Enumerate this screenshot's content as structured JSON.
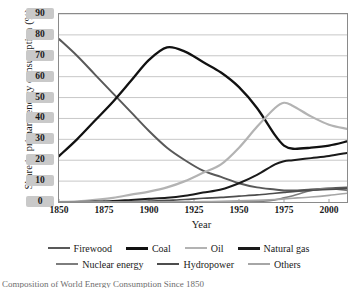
{
  "chart_data": {
    "type": "line",
    "title": "",
    "xlabel": "Year",
    "ylabel": "Share in primary energy consumption  (%)",
    "xlim": [
      1850,
      2010
    ],
    "ylim": [
      0,
      90
    ],
    "xticks": [
      1850,
      1875,
      1900,
      1925,
      1950,
      1975,
      2000
    ],
    "yticks": [
      0,
      10,
      20,
      30,
      40,
      50,
      60,
      70,
      80,
      90
    ],
    "grid": "horizontal",
    "legend_position": "bottom",
    "x": [
      1850,
      1860,
      1870,
      1880,
      1890,
      1900,
      1910,
      1920,
      1930,
      1940,
      1950,
      1960,
      1970,
      1975,
      1980,
      1990,
      2000,
      2010
    ],
    "series": [
      {
        "name": "Firewood",
        "color": "#595959",
        "width": 2.0,
        "values": [
          78,
          70,
          61,
          52,
          43,
          34,
          26,
          20,
          15,
          12,
          9,
          7,
          6,
          5.5,
          5.5,
          6,
          6.5,
          7
        ]
      },
      {
        "name": "Coal",
        "color": "#111111",
        "width": 2.3,
        "values": [
          22,
          30,
          39,
          48,
          58,
          68,
          74,
          72,
          67,
          62,
          55,
          45,
          32,
          27,
          25.5,
          26,
          27,
          29
        ]
      },
      {
        "name": "Oil",
        "color": "#b3b3b3",
        "width": 2.2,
        "values": [
          0,
          0.3,
          1,
          2,
          3.5,
          5,
          7,
          10,
          14,
          18,
          26,
          36,
          45,
          47.5,
          46,
          41,
          37,
          35
        ]
      },
      {
        "name": "Natural gas",
        "color": "#1a1a1a",
        "width": 2.0,
        "values": [
          0,
          0,
          0.2,
          0.5,
          1,
          1.5,
          2,
          3,
          4.5,
          6,
          9,
          13,
          18,
          19.5,
          20,
          21,
          22,
          23.5
        ]
      },
      {
        "name": "Nuclear energy",
        "color": "#7d7d7d",
        "width": 1.7,
        "values": [
          0,
          0,
          0,
          0,
          0,
          0,
          0,
          0,
          0,
          0,
          0,
          0.2,
          1,
          2,
          3,
          5.5,
          6.5,
          5.5
        ]
      },
      {
        "name": "Hydropower",
        "color": "#4d4d4d",
        "width": 1.7,
        "values": [
          0,
          0,
          0,
          0,
          0.2,
          0.4,
          0.8,
          1.2,
          1.8,
          2.2,
          2.8,
          3.4,
          4.2,
          4.6,
          5,
          5.6,
          6,
          6.4
        ]
      },
      {
        "name": "Others",
        "color": "#a6a6a6",
        "width": 1.7,
        "values": [
          0,
          0,
          0,
          0,
          0,
          0,
          0,
          0,
          0.2,
          0.3,
          0.5,
          0.8,
          1.2,
          1.5,
          1.8,
          2.4,
          3.2,
          4.2
        ]
      }
    ]
  },
  "axis": {
    "y_title": "Share in primary energy consumption  (%)",
    "x_title": "Year",
    "y_labels": [
      "90",
      "80",
      "70",
      "60",
      "50",
      "40",
      "30",
      "20",
      "10",
      "0"
    ],
    "x_labels": [
      "1850",
      "1875",
      "1900",
      "1925",
      "1950",
      "1975",
      "2000"
    ]
  },
  "legend": {
    "row1": [
      {
        "label": "Firewood",
        "color": "#595959",
        "width": "2px"
      },
      {
        "label": "Coal",
        "color": "#111111",
        "width": "3px"
      },
      {
        "label": "Oil",
        "color": "#b3b3b3",
        "width": "2px"
      },
      {
        "label": "Natural gas",
        "color": "#1a1a1a",
        "width": "3px"
      }
    ],
    "row2": [
      {
        "label": "Nuclear energy",
        "color": "#7d7d7d",
        "width": "2px"
      },
      {
        "label": "Hydropower",
        "color": "#4d4d4d",
        "width": "2px"
      },
      {
        "label": "Others",
        "color": "#a6a6a6",
        "width": "2px"
      }
    ]
  },
  "caption": {
    "text": "Composition of World Energy Consumption Since 1850"
  }
}
